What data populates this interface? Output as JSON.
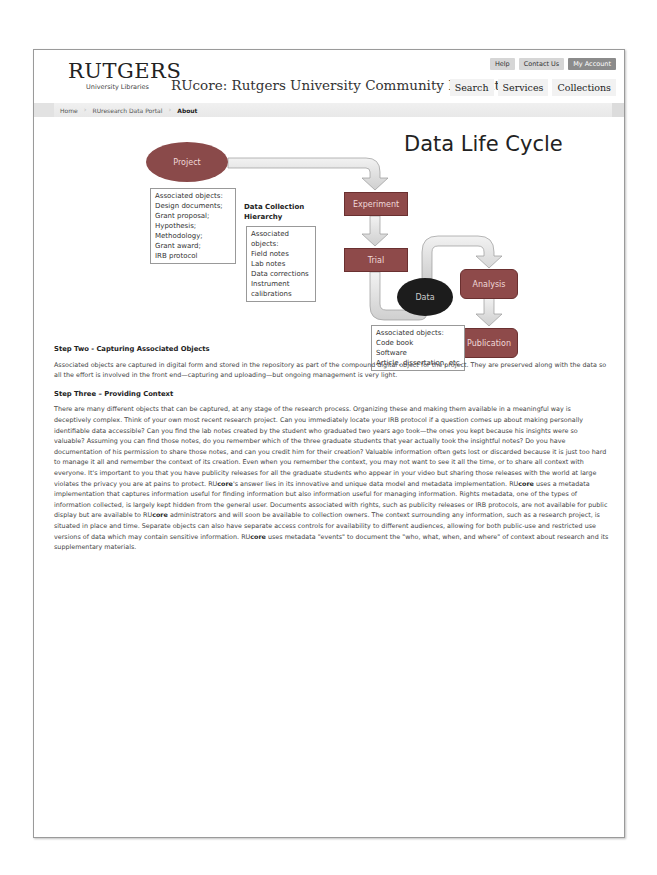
{
  "header": {
    "logo_main": "RUTGERS",
    "logo_sub": "University Libraries",
    "site_title": "RUcore: Rutgers University Community Repository",
    "util_links": [
      "Help",
      "Contact Us",
      "My Account"
    ],
    "main_nav": [
      "Search",
      "Services",
      "Collections"
    ]
  },
  "breadcrumb": {
    "items": [
      "Home",
      "RUresearch Data Portal",
      "About"
    ]
  },
  "diagram": {
    "title": "Data Life Cycle",
    "nodes": {
      "project": "Project",
      "experiment": "Experiment",
      "trial": "Trial",
      "data": "Data",
      "analysis": "Analysis",
      "publication": "Publication"
    },
    "project_objects": [
      "Associated objects:",
      "Design documents;",
      "Grant proposal;",
      "Hypothesis;",
      "Methodology;",
      "Grant award;",
      "IRB protocol"
    ],
    "hierarchy_title_1": "Data Collection",
    "hierarchy_title_2": "Hierarchy",
    "hierarchy_objects": [
      "Associated",
      "objects:",
      "Field notes",
      "Lab notes",
      "Data corrections",
      "Instrument",
      "calibrations"
    ],
    "data_objects": [
      "Associated objects:",
      "Code book",
      "Software",
      "Article, dissertation, etc."
    ]
  },
  "content": {
    "step2_heading": "Step Two - Capturing Associated Objects",
    "step2_text": "Associated objects are captured in digital form and stored in the repository as part of the compound digital object for the project. They are preserved along with the data so all the effort is involved in the front end—capturing and uploading—but ongoing management is very light.",
    "step3_heading": "Step Three – Providing Context",
    "step3_part1": "There are many different objects that can be captured, at any stage of the research process. Organizing these and making them available in a meaningful way is deceptively complex. Think of your own most recent research project. Can you immediately locate your IRB protocol if a question comes up about making personally identifiable data accessible? Can you find the lab notes created by the student who graduated two years ago took—the ones you kept because his insights were so valuable? Assuming you can find those notes, do you remember which of the three graduate students that year actually took the insightful notes? Do you have documentation of his permission to share those notes, and can you credit him for their creation? Valuable information often gets lost or discarded because it is just too hard to manage it all and remember the context of its creation. Even when you remember the context, you may not want to see it all the time, or to share all context with everyone. It's important to you that you have publicity releases for all the graduate students who appear in your video but sharing those releases with the world at large violates the privacy you are at pains to protect. RU",
    "core_word": "core",
    "step3_part2": "'s answer lies in its innovative and unique data model and metadata implementation. RU",
    "step3_part3": " uses a metadata implementation that captures information useful for finding information but also information useful for managing information. Rights metadata, one of the types of information collected, is largely kept hidden from the general user. Documents associated with rights, such as publicity releases or IRB protocols, are not available for public display but are available to RU",
    "step3_part4": " administrators and will soon be available to collection owners. The context surrounding any information, such as a research project, is situated in place and time. Separate objects can also have separate access controls for availability to different audiences, allowing for both public-use and restricted use versions of data which may contain sensitive information. RU",
    "step3_part5": " uses metadata \"events\" to document the \"who, what, when, and where\" of context about research and its supplementary materials."
  },
  "colors": {
    "node_fill": "#8e4a4a",
    "data_fill": "#1c1c1c",
    "arrow_fill": "#dcdcdc",
    "button_dark": "#8b8b8b",
    "button_light": "#d6d6d6"
  }
}
